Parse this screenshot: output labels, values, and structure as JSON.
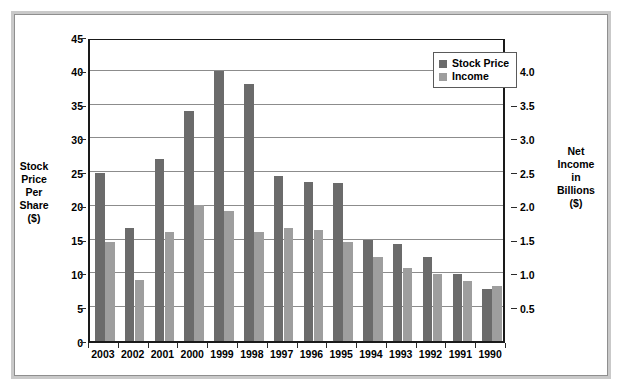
{
  "chart_data": {
    "type": "bar",
    "title": "",
    "subtitle": "",
    "xlabel": "",
    "ylabel": "Stock Price Per Share ($)",
    "ylabel_lines": [
      "Stock",
      "Price",
      "Per",
      "Share",
      "($)"
    ],
    "y2label": "Net Income in Billions ($)",
    "y2label_lines": [
      "Net",
      "Income",
      "in",
      "Billions",
      "($)"
    ],
    "categories": [
      "2003",
      "2002",
      "2001",
      "2000",
      "1999",
      "1998",
      "1997",
      "1996",
      "1995",
      "1994",
      "1993",
      "1992",
      "1991",
      "1990"
    ],
    "series": [
      {
        "name": "Stock Price",
        "axis": "left",
        "unit": "$ per share",
        "color": "#6b6b6b",
        "values": [
          24.8,
          16.8,
          27.0,
          34.0,
          40.0,
          38.1,
          24.4,
          23.6,
          23.4,
          14.9,
          14.4,
          12.4,
          9.9,
          7.7
        ]
      },
      {
        "name": "Income",
        "axis": "right",
        "unit": "billions ($)",
        "color": "#9e9e9e",
        "values": [
          1.47,
          0.9,
          1.62,
          2.02,
          1.93,
          1.62,
          1.67,
          1.64,
          1.47,
          1.25,
          1.08,
          0.99,
          0.89,
          0.82
        ]
      }
    ],
    "ylim": [
      0,
      45
    ],
    "yticks": [
      0,
      5,
      10,
      15,
      20,
      25,
      30,
      35,
      40,
      45
    ],
    "ytick_labels": [
      "0",
      "5",
      "10",
      "15",
      "20",
      "25",
      "30",
      "35",
      "40",
      "45"
    ],
    "y2lim": [
      0,
      4.5
    ],
    "y2ticks": [
      0.5,
      1.0,
      1.5,
      2.0,
      2.5,
      3.0,
      3.5,
      4.0
    ],
    "y2tick_labels": [
      "0.5",
      "1.0",
      "1.5",
      "2.0",
      "2.5",
      "3.0",
      "3.5",
      "4.0"
    ],
    "grid": true,
    "grid_axis": "y",
    "legend": {
      "position": "top-right-inside",
      "entries": [
        {
          "label": "Stock Price",
          "color": "#6b6b6b"
        },
        {
          "label": "Income",
          "color": "#9e9e9e"
        }
      ]
    }
  },
  "colors": {
    "stock_price": "#6b6b6b",
    "income": "#9e9e9e",
    "gridline": "#8c8c8c",
    "axis": "#1a1a1a",
    "frame_outer": "#c9c9c9",
    "frame_inner": "#8f8f8f",
    "background": "#ffffff"
  }
}
